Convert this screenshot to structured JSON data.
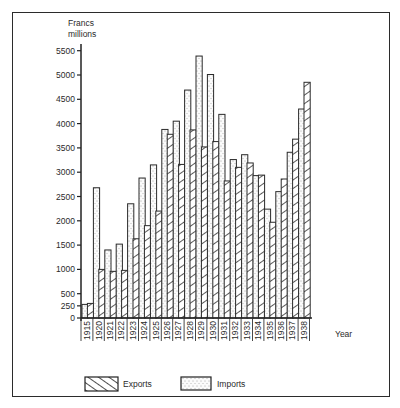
{
  "chart_data": {
    "type": "bar",
    "title": "",
    "ylabel": "Francs millions",
    "ylabel_lines": [
      "Francs",
      "millions"
    ],
    "xlabel": "Year",
    "ylim": [
      0,
      5500
    ],
    "yticks": [
      0,
      250,
      500,
      1000,
      1500,
      2000,
      2500,
      3000,
      3500,
      4000,
      4500,
      5000,
      5500
    ],
    "grid": false,
    "legend_position": "bottom",
    "categories": [
      "1915",
      "1920",
      "1921",
      "1922",
      "1923",
      "1924",
      "1925",
      "1926",
      "1927",
      "1928",
      "1929",
      "1930",
      "1931",
      "1932",
      "1933",
      "1934",
      "1935",
      "1936",
      "1937",
      "1938"
    ],
    "series": [
      {
        "name": "Imports",
        "pattern": "dots",
        "values": [
          280,
          2680,
          1400,
          1520,
          2350,
          2880,
          3150,
          3880,
          4050,
          4690,
          5390,
          5010,
          4190,
          3260,
          3360,
          2930,
          2240,
          2600,
          3410,
          4300
        ]
      },
      {
        "name": "Exports",
        "pattern": "hatch",
        "values": [
          300,
          1000,
          960,
          980,
          1630,
          1900,
          2200,
          3780,
          3160,
          3870,
          3520,
          3630,
          2820,
          3100,
          3190,
          2940,
          1970,
          2860,
          3680,
          4850
        ]
      }
    ]
  },
  "legend": {
    "exports_label": "Exports",
    "imports_label": "Imports"
  },
  "axis": {
    "ylabel_line1": "Francs",
    "ylabel_line2": "millions",
    "xlabel": "Year"
  }
}
